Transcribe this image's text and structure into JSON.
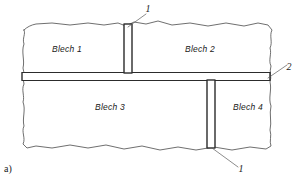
{
  "figure": {
    "subfigure_label": "a)",
    "plates": [
      {
        "id": "plate-1",
        "label": "Blech 1",
        "x": 67,
        "y": 52
      },
      {
        "id": "plate-2",
        "label": "Blech 2",
        "x": 200,
        "y": 52
      },
      {
        "id": "plate-3",
        "label": "Blech 3",
        "x": 110,
        "y": 110
      },
      {
        "id": "plate-4",
        "label": "Blech 4",
        "x": 248,
        "y": 110
      }
    ],
    "callouts": [
      {
        "id": "callout-top",
        "label": "1",
        "x": 148,
        "y": 12
      },
      {
        "id": "callout-right",
        "label": "2",
        "x": 289,
        "y": 70
      },
      {
        "id": "callout-bottom",
        "label": "1",
        "x": 241,
        "y": 172
      }
    ],
    "welds": [
      {
        "id": "weld-seam-horizontal",
        "orientation": "horizontal",
        "callout": "2"
      },
      {
        "id": "weld-seam-vertical-upper",
        "orientation": "vertical",
        "callout": "1"
      },
      {
        "id": "weld-seam-vertical-lower",
        "orientation": "vertical",
        "callout": "1"
      }
    ],
    "colors": {
      "outline": "#4a4a4a",
      "weld": "#1e1e1e",
      "leader": "#5a5a5a",
      "text": "#1a1a1a",
      "background": "#ffffff"
    }
  }
}
